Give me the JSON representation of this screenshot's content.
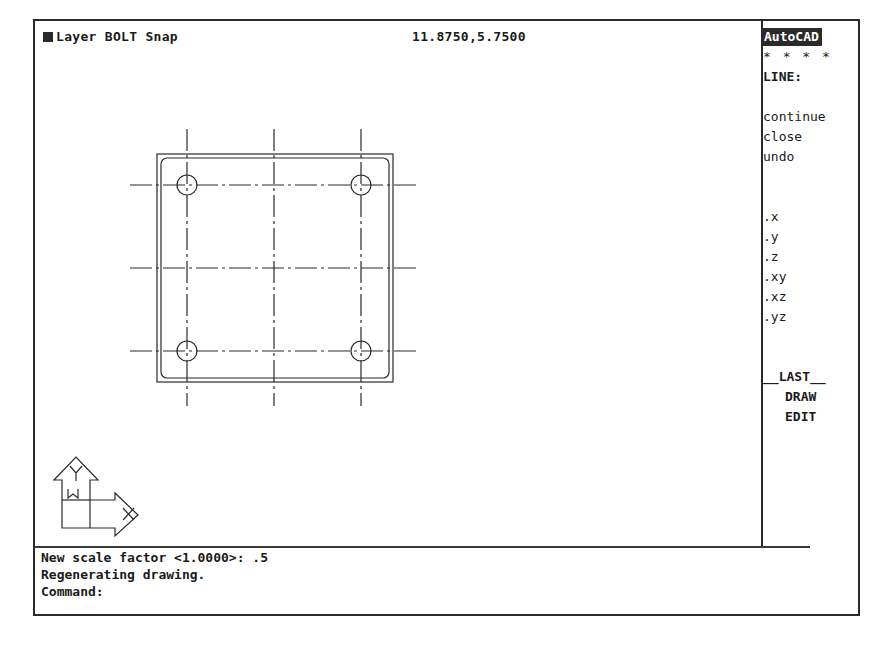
{
  "status_bar": {
    "layer_label": "Layer BOLT Snap",
    "coordinates": "11.8750,5.7500"
  },
  "side_menu": {
    "title": "AutoCAD",
    "stars": "* * * *",
    "command": "LINE:",
    "items": [
      {
        "label": "continue"
      },
      {
        "label": "close"
      },
      {
        "label": "undo"
      },
      {
        "label": ".x"
      },
      {
        "label": ".y"
      },
      {
        "label": ".z"
      },
      {
        "label": ".xy"
      },
      {
        "label": ".xz"
      },
      {
        "label": ".yz"
      },
      {
        "label": "__LAST__"
      },
      {
        "label": "DRAW"
      },
      {
        "label": "EDIT"
      }
    ]
  },
  "command_area": {
    "lines": [
      "New scale factor <1.0000>: .5",
      "Regenerating drawing.",
      "Command:"
    ]
  },
  "ucs_icon": {
    "x_label": "X",
    "y_label": "Y",
    "w_label": "W"
  },
  "colors": {
    "foreground": "#1a1a1a",
    "background": "#ffffff",
    "title_bg": "#2a2a2a"
  }
}
